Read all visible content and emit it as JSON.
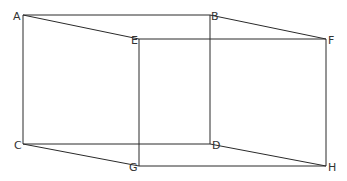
{
  "diagram": {
    "type": "cuboid-wireframe",
    "vertices": {
      "A": {
        "label": "A",
        "x": 23,
        "y": 15
      },
      "B": {
        "label": "B",
        "x": 210,
        "y": 15
      },
      "C": {
        "label": "C",
        "x": 23,
        "y": 144
      },
      "D": {
        "label": "D",
        "x": 210,
        "y": 144
      },
      "E": {
        "label": "E",
        "x": 139,
        "y": 39
      },
      "F": {
        "label": "F",
        "x": 326,
        "y": 39
      },
      "G": {
        "label": "G",
        "x": 139,
        "y": 166
      },
      "H": {
        "label": "H",
        "x": 326,
        "y": 166
      }
    },
    "edges": [
      [
        "A",
        "B"
      ],
      [
        "A",
        "C"
      ],
      [
        "B",
        "D"
      ],
      [
        "C",
        "D"
      ],
      [
        "E",
        "F"
      ],
      [
        "E",
        "G"
      ],
      [
        "F",
        "H"
      ],
      [
        "G",
        "H"
      ],
      [
        "A",
        "E"
      ],
      [
        "B",
        "F"
      ],
      [
        "C",
        "G"
      ],
      [
        "D",
        "H"
      ]
    ],
    "colors": {
      "line": "#2a2a2a",
      "label": "#333333",
      "background": "#ffffff"
    }
  }
}
